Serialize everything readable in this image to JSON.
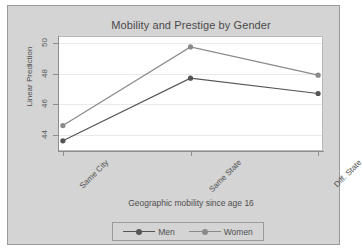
{
  "chart_data": {
    "type": "line",
    "title": "Mobility and Prestige by Gender",
    "xlabel": "Geographic mobility since age 16",
    "ylabel": "Linear Prediction",
    "categories": [
      "Same City",
      "Same State",
      "Diff. State"
    ],
    "series": [
      {
        "name": "Men",
        "values": [
          43.6,
          47.7,
          46.7
        ],
        "color": "#555555",
        "marker": "circle"
      },
      {
        "name": "Women",
        "values": [
          44.6,
          49.75,
          47.9
        ],
        "color": "#8a8a8a",
        "marker": "circle"
      }
    ],
    "yticks": [
      44,
      46,
      48,
      50
    ],
    "ylim": [
      43.0,
      50.4
    ],
    "grid": "horizontal",
    "legend_position": "bottom"
  },
  "figure": {
    "title": "Mobility and Prestige by Gender",
    "x_axis_title": "Geographic mobility since age 16",
    "y_axis_title": "Linear Prediction",
    "y_tick_labels": [
      "44",
      "46",
      "48",
      "50"
    ],
    "x_tick_labels": [
      "Same City",
      "Same State",
      "Diff. State"
    ],
    "legend": {
      "items": [
        {
          "label": "Men",
          "color": "#555555",
          "key_icon": "line-marker-icon"
        },
        {
          "label": "Women",
          "color": "#8a8a8a",
          "key_icon": "line-marker-icon"
        }
      ]
    },
    "colors": {
      "graph_background": "#d4d4d4",
      "plot_background": "#ffffff",
      "frame": "#9a9a9a",
      "gridline": "#e9e9e9",
      "men": "#555555",
      "women": "#8a8a8a"
    }
  }
}
